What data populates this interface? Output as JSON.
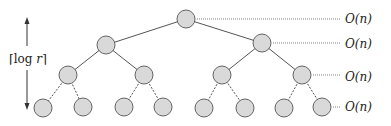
{
  "diagram": {
    "type": "recursion-tree",
    "height_label": {
      "prefix": "⌈log ",
      "var": "r",
      "suffix": "⌉"
    },
    "level_costs": [
      "O(n)",
      "O(n)",
      "O(n)",
      "O(n)"
    ],
    "node_fill": "#d9d9d9",
    "node_stroke": "#555555",
    "levels": [
      [
        {
          "x": 186,
          "y": 19
        }
      ],
      [
        {
          "x": 106,
          "y": 45
        },
        {
          "x": 262,
          "y": 43
        }
      ],
      [
        {
          "x": 68,
          "y": 75
        },
        {
          "x": 144,
          "y": 75
        },
        {
          "x": 222,
          "y": 75
        },
        {
          "x": 302,
          "y": 75
        }
      ],
      [
        {
          "x": 43,
          "y": 108
        },
        {
          "x": 83,
          "y": 107
        },
        {
          "x": 124,
          "y": 107
        },
        {
          "x": 163,
          "y": 107
        },
        {
          "x": 204,
          "y": 108
        },
        {
          "x": 245,
          "y": 108
        },
        {
          "x": 284,
          "y": 108
        },
        {
          "x": 322,
          "y": 107
        }
      ]
    ]
  }
}
